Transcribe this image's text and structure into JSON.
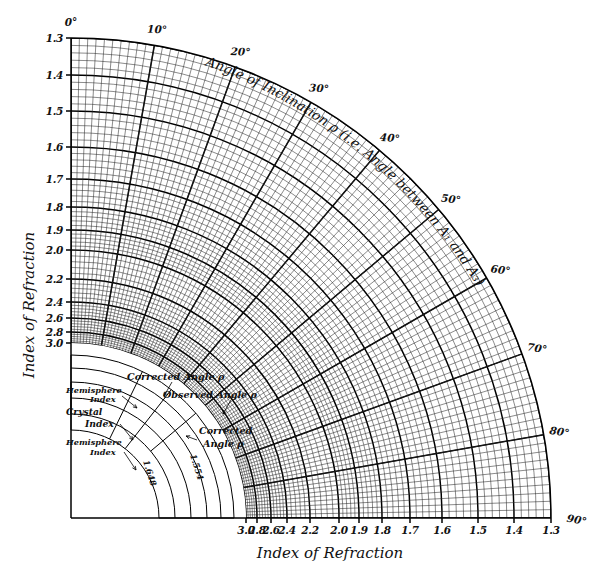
{
  "figure": {
    "type": "nomogram",
    "background_color": "#ffffff",
    "ink_color": "#000000"
  },
  "axes": {
    "left": {
      "title": "Index of Refraction",
      "ticks": [
        "1.3",
        "1.4",
        "1.5",
        "1.6",
        "1.7",
        "1.8",
        "1.9",
        "2.0",
        "2.2",
        "2.4",
        "2.6",
        "2.8",
        "3.0"
      ]
    },
    "bottom": {
      "title": "Index of Refraction",
      "ticks": [
        "3.0",
        "2.8",
        "2.6",
        "2.4",
        "2.2",
        "2.0",
        "1.9",
        "1.8",
        "1.7",
        "1.6",
        "1.5",
        "1.4",
        "1.3"
      ]
    },
    "arc": {
      "title": "Angle of Inclination ρ (i.e. Angle between A₁ and A₃)",
      "ticks": [
        "0°",
        "10°",
        "20°",
        "30°",
        "40°",
        "50°",
        "60°",
        "70°",
        "80°",
        "90°"
      ]
    }
  },
  "inset": {
    "labels": {
      "corrected_angle_top": "Corrected Angle ρ",
      "observed_angle": "Observed Angle ρ",
      "corrected_angle_right_line1": "Corrected",
      "corrected_angle_right_line2": "Angle ρ",
      "hemisphere_index_upper_line1": "Hemisphere",
      "hemisphere_index_upper_line2": "Index",
      "crystal_index_line1": "Crystal",
      "crystal_index_line2": "Index",
      "hemisphere_index_lower_line1": "Hemisphere",
      "hemisphere_index_lower_line2": "Index"
    },
    "values": {
      "inner_radial": "1.648",
      "outer_radial": "1.554"
    }
  },
  "chart_data": {
    "type": "line",
    "title": "Angle of Inclination ρ (i.e. Angle between A₁ and A₃)",
    "xlabel": "Index of Refraction",
    "ylabel": "Index of Refraction",
    "coordinate_system": "polar-quadrant",
    "grid": true,
    "legend": "none",
    "origin_px": [
      71,
      518
    ],
    "outer_radius_px": 480,
    "inner_blank_radius_px": 175,
    "angular_range_deg": [
      0,
      90
    ],
    "angular_major_ticks_deg": [
      0,
      10,
      20,
      30,
      40,
      50,
      60,
      70,
      80,
      90
    ],
    "angular_minor_step_deg": 2,
    "radial_tick_labels": [
      "1.3",
      "1.4",
      "1.5",
      "1.6",
      "1.7",
      "1.8",
      "1.9",
      "2.0",
      "2.2",
      "2.4",
      "2.6",
      "2.8",
      "3.0"
    ],
    "radial_tick_radii_px": [
      480,
      443,
      407,
      371,
      339,
      311,
      288,
      268,
      239,
      216,
      200,
      186,
      175
    ],
    "radial_minor_subdivisions": 5,
    "series": [
      {
        "name": "radial index grid",
        "values": [
          1.3,
          1.4,
          1.5,
          1.6,
          1.7,
          1.8,
          1.9,
          2.0,
          2.2,
          2.4,
          2.6,
          2.8,
          3.0
        ]
      },
      {
        "name": "angular inclination grid",
        "values": [
          0,
          10,
          20,
          30,
          40,
          50,
          60,
          70,
          80,
          90
        ]
      }
    ],
    "annotations": [
      {
        "text": "Corrected Angle ρ",
        "x_px": 132,
        "y_px": 378
      },
      {
        "text": "Observed Angle ρ",
        "x_px": 180,
        "y_px": 398
      },
      {
        "text": "Corrected Angle ρ",
        "x_px": 200,
        "y_px": 432
      },
      {
        "text": "Hemisphere Index",
        "x_px": 68,
        "y_px": 392
      },
      {
        "text": "Crystal Index",
        "x_px": 68,
        "y_px": 412
      },
      {
        "text": "Hemisphere Index",
        "x_px": 68,
        "y_px": 440
      },
      {
        "text": "1.648",
        "x_px": 148,
        "y_px": 480
      },
      {
        "text": "1.554",
        "x_px": 192,
        "y_px": 470
      }
    ]
  }
}
